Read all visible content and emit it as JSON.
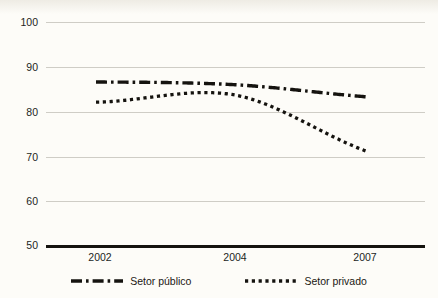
{
  "figure": {
    "background_color": "#fdfcf8",
    "ink_color": "#15130f",
    "gridline_color": "#cfcdc6"
  },
  "axis": {
    "y_ticks": [
      "100",
      "90",
      "80",
      "70",
      "60",
      "50"
    ],
    "x_ticks": [
      "2002",
      "2004",
      "2007"
    ]
  },
  "legend": {
    "items": [
      {
        "label": "Setor público",
        "style": "dash-dot",
        "icon": "dash-dot-line-icon"
      },
      {
        "label": "Setor privado",
        "style": "dotted",
        "icon": "dotted-line-icon"
      }
    ]
  },
  "chart_data": {
    "type": "line",
    "title": "",
    "subtitle": "",
    "xlabel": "",
    "ylabel": "",
    "categories": [
      "2002",
      "2004",
      "2007"
    ],
    "x": [
      2002,
      2004,
      2007
    ],
    "ylim": [
      50,
      100
    ],
    "y_ticks": [
      50,
      60,
      70,
      80,
      90,
      100
    ],
    "xlim": [
      2002,
      2007
    ],
    "grid": "horizontal",
    "legend_position": "bottom",
    "series": [
      {
        "name": "Setor público",
        "line_style": "dash-dot",
        "color": "#15130f",
        "values": [
          86.6,
          86.0,
          83.3
        ]
      },
      {
        "name": "Setor privado",
        "line_style": "dotted",
        "color": "#15130f",
        "values": [
          82.1,
          83.7,
          71.2
        ]
      }
    ],
    "annotations": []
  }
}
